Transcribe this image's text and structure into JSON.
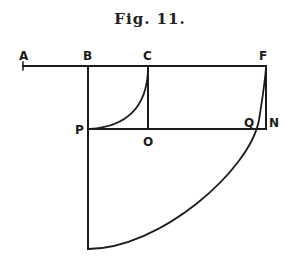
{
  "figure": {
    "caption": "Fig. 11.",
    "points": {
      "A": {
        "label": "A",
        "x": 23,
        "y": 66
      },
      "B": {
        "label": "B",
        "x": 88,
        "y": 66
      },
      "C": {
        "label": "C",
        "x": 148,
        "y": 66
      },
      "F": {
        "label": "F",
        "x": 266,
        "y": 66
      },
      "P": {
        "label": "P",
        "x": 88,
        "y": 129
      },
      "O": {
        "label": "O",
        "x": 148,
        "y": 129
      },
      "Q": {
        "label": "Q",
        "x": 250,
        "y": 129
      },
      "N": {
        "label": "N",
        "x": 266,
        "y": 129
      }
    },
    "colors": {
      "ink": "#1c1c1c",
      "background": "#ffffff"
    }
  }
}
